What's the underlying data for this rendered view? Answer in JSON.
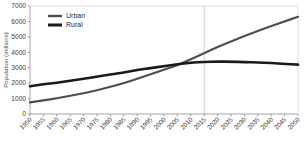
{
  "chart_data": {
    "type": "line",
    "title": "",
    "xlabel": "",
    "ylabel": "Population (millions)",
    "xlim": [
      1950,
      2050
    ],
    "ylim": [
      0,
      7000
    ],
    "ytick_step": 1000,
    "xtick_step": 5,
    "grid": false,
    "legend_position": "top-left",
    "x": [
      1950,
      1955,
      1960,
      1965,
      1970,
      1975,
      1980,
      1985,
      1990,
      1995,
      2000,
      2005,
      2010,
      2015,
      2020,
      2025,
      2030,
      2035,
      2040,
      2045,
      2050
    ],
    "xtick_labels": [
      "1950",
      "1955",
      "1960",
      "1965",
      "1970",
      "1975",
      "1980",
      "1985",
      "1990",
      "1995",
      "2000",
      "2005",
      "2010",
      "2015",
      "2020",
      "2025",
      "2030",
      "2035",
      "2040",
      "2045",
      "2050"
    ],
    "ytick_labels": [
      "0",
      "1000",
      "2000",
      "3000",
      "4000",
      "5000",
      "6000",
      "7000"
    ],
    "ytick_values": [
      0,
      1000,
      2000,
      3000,
      4000,
      5000,
      6000,
      7000
    ],
    "series": [
      {
        "name": "Urban",
        "color": "#4f4f4f",
        "stroke_width": 2.2,
        "values": [
          750,
          880,
          1020,
          1180,
          1350,
          1540,
          1760,
          2000,
          2280,
          2580,
          2870,
          3150,
          3550,
          3950,
          4350,
          4700,
          5050,
          5380,
          5700,
          6000,
          6300
        ]
      },
      {
        "name": "Rural",
        "color": "#1a1a1a",
        "stroke_width": 2.6,
        "values": [
          1800,
          1920,
          2030,
          2150,
          2280,
          2420,
          2560,
          2700,
          2850,
          2980,
          3100,
          3220,
          3320,
          3380,
          3400,
          3390,
          3370,
          3340,
          3300,
          3250,
          3200
        ]
      }
    ],
    "annotations": [
      {
        "type": "vertical-reference-line",
        "x": 2015,
        "color": "#c9c9c9"
      }
    ],
    "legend_entries": [
      {
        "label": "Urban",
        "color": "#4f4f4f"
      },
      {
        "label": "Rural",
        "color": "#1a1a1a"
      }
    ]
  }
}
